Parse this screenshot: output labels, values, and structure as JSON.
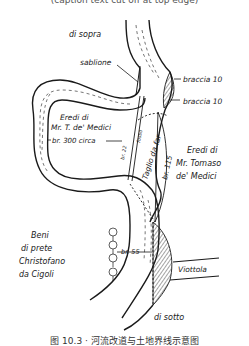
{
  "figure": {
    "caption_top": "(caption text cut off at top edge)",
    "caption_bottom": "图 10.3 · 河流改道与土地界线示意图"
  },
  "labels": {
    "north": "di sopra",
    "south": "di sotto",
    "sandbank": "sablione",
    "braccia_upper": "braccia  10",
    "braccia_lower": "braccia  10",
    "heirs_left_1": "Eredi di",
    "heirs_left_2": "Mr. T. de' Medici",
    "width_300": "br. 300 circa",
    "ditch": "fosso",
    "br22": "br. 22",
    "cut": "Taglio da far",
    "br115": "br. 115",
    "heirs_right_1": "Eredi di",
    "heirs_right_2": "Mr. Tomaso",
    "heirs_right_3": "de' Medici",
    "priest_1": "Beni",
    "priest_2": "di prete",
    "priest_3": "Christofano",
    "priest_4": "da Cigoli",
    "br55": "br. 55",
    "lane": "Viottola"
  },
  "colors": {
    "ink": "#1a1a1a",
    "paper": "#ffffff"
  }
}
